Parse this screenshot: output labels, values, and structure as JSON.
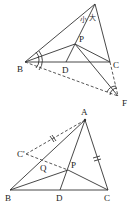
{
  "figure1": {
    "labels": {
      "B": "B",
      "D": "D",
      "C": "C",
      "P": "P",
      "F": "F"
    },
    "annotations": {
      "small": "小",
      "large": "大"
    }
  },
  "figure2": {
    "labels": {
      "A": "A",
      "B": "B",
      "C": "C",
      "D": "D",
      "P": "P",
      "Q": "Q",
      "Cprime": "C'"
    }
  },
  "colors": {
    "line": "#333333",
    "background": "#ffffff"
  }
}
